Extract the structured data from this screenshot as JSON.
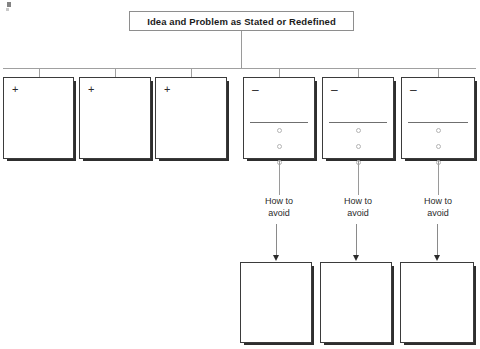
{
  "diagram": {
    "title": "Idea and Problem as Stated or Redefined",
    "columns": [
      {
        "sign": "+",
        "type": "plus",
        "has_rule": false,
        "bullets": 0,
        "avoid_label_line1": "",
        "avoid_label_line2": "",
        "has_followup": false
      },
      {
        "sign": "+",
        "type": "plus",
        "has_rule": false,
        "bullets": 0,
        "avoid_label_line1": "",
        "avoid_label_line2": "",
        "has_followup": false
      },
      {
        "sign": "+",
        "type": "plus",
        "has_rule": false,
        "bullets": 0,
        "avoid_label_line1": "",
        "avoid_label_line2": "",
        "has_followup": false
      },
      {
        "sign": "–",
        "type": "minus",
        "has_rule": true,
        "bullets": 3,
        "avoid_label_line1": "How to",
        "avoid_label_line2": "avoid",
        "has_followup": true
      },
      {
        "sign": "–",
        "type": "minus",
        "has_rule": true,
        "bullets": 3,
        "avoid_label_line1": "How to",
        "avoid_label_line2": "avoid",
        "has_followup": true
      },
      {
        "sign": "–",
        "type": "minus",
        "has_rule": true,
        "bullets": 3,
        "avoid_label_line1": "How to",
        "avoid_label_line2": "avoid",
        "has_followup": true
      }
    ],
    "colors": {
      "card_border": "#3b3b3b",
      "card_shadow": "#2e2e2e",
      "connector": "#9a9a9a",
      "title_border": "#8e8e8e",
      "text": "#1b1b1b",
      "bullet_border": "#b4b4b4"
    },
    "geometry": {
      "card_lefts": [
        3,
        79,
        155,
        243,
        322,
        401
      ],
      "card_widths": [
        71,
        72,
        72,
        72,
        72,
        74
      ],
      "bottom_lefts": [
        240,
        320,
        400
      ],
      "bottom_widths": [
        72,
        72,
        74
      ]
    }
  }
}
